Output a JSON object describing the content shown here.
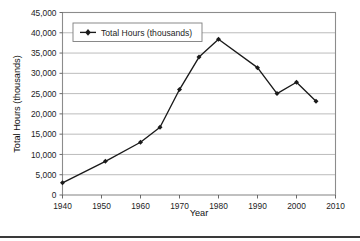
{
  "chart_data": {
    "type": "line",
    "title": "",
    "xlabel": "Year",
    "ylabel": "Total Hours (thousands)",
    "xlim": [
      1940,
      2010
    ],
    "ylim": [
      0,
      45000
    ],
    "grid": "horizontal",
    "legend_position": "top-left",
    "legend_entries": [
      "Total Hours (thousands)"
    ],
    "xticks": [
      1940,
      1950,
      1960,
      1970,
      1980,
      1990,
      2000,
      2010
    ],
    "xtick_labels": [
      "1940",
      "1950",
      "1960",
      "1970",
      "1980",
      "1990",
      "2000",
      "2010"
    ],
    "yticks": [
      0,
      5000,
      10000,
      15000,
      20000,
      25000,
      30000,
      35000,
      40000,
      45000
    ],
    "ytick_labels": [
      "0",
      "5,000",
      "10,000",
      "15,000",
      "20,000",
      "25,000",
      "30,000",
      "35,000",
      "40,000",
      "45,000"
    ],
    "series": [
      {
        "name": "Total Hours (thousands)",
        "color": "#1a1a1a",
        "marker": "diamond",
        "x": [
          1940,
          1951,
          1960,
          1965,
          1970,
          1975,
          1980,
          1990,
          1995,
          2000,
          2005
        ],
        "values": [
          3000,
          8300,
          13000,
          16700,
          26000,
          34000,
          38400,
          31400,
          25000,
          27800,
          23100
        ]
      }
    ]
  },
  "axes": {
    "x_title": "Year",
    "y_title": "Total Hours (thousands)"
  },
  "legend": {
    "label": "Total Hours (thousands)"
  }
}
